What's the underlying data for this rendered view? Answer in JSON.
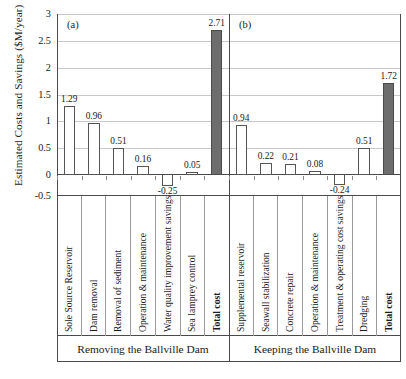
{
  "chart_data": {
    "type": "bar",
    "title": "",
    "ylabel": "Estimated Costs and Savings ($M/year)",
    "xlabel": "",
    "ylim": [
      -0.5,
      3
    ],
    "yticks": [
      3,
      2.5,
      2,
      1.5,
      1,
      0.5,
      0,
      -0.5
    ],
    "ytick_labels": [
      "3",
      "2.5",
      "2",
      "1.5",
      "1",
      "0.5",
      "0",
      "-0.5"
    ],
    "grid": true,
    "legend": "none",
    "panels": [
      {
        "tag": "(a)",
        "caption": "Removing the Ballville Dam",
        "categories": [
          "Sole Source Reservoir",
          "Dam removal",
          "Removal of sediment",
          "Operation & maintenance",
          "Water quality improvement savings",
          "Sea lamprey control",
          "Total cost"
        ],
        "values": [
          1.29,
          0.96,
          0.51,
          0.16,
          -0.25,
          0.05,
          2.71
        ],
        "value_labels": [
          "1.29",
          "0.96",
          "0.51",
          "0.16",
          "-0.25",
          "0.05",
          "2.71"
        ],
        "total_index": 6
      },
      {
        "tag": "(b)",
        "caption": "Keeping the Ballville Dam",
        "categories": [
          "Supplemental reservoir",
          "Seawall stabilization",
          "Concrete repair",
          "Operation & maintenance",
          "Treatment & operating cost savings",
          "Dredging",
          "Total cost"
        ],
        "values": [
          0.94,
          0.22,
          0.21,
          0.08,
          -0.24,
          0.51,
          1.72
        ],
        "value_labels": [
          "0.94",
          "0.22",
          "0.21",
          "0.08",
          "-0.24",
          "0.51",
          "1.72"
        ],
        "total_index": 6
      }
    ],
    "colors": {
      "bar_fill": "#ffffff",
      "bar_edge": "#555555",
      "total_fill": "#6d6d6d",
      "axis": "#4a4a4a",
      "grid": "#c9c9c9"
    }
  }
}
